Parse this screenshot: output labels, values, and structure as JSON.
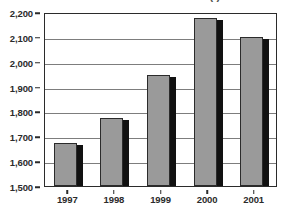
{
  "chart_data": {
    "type": "bar",
    "title": "(  )",
    "xlabel": "",
    "ylabel": "",
    "categories": [
      "1997",
      "1998",
      "1999",
      "2000",
      "2001"
    ],
    "values": [
      1672,
      1775,
      1945,
      2175,
      2100
    ],
    "ylim": [
      1500,
      2200
    ],
    "ytick_labels": [
      "2,200",
      "2,100",
      "2,000",
      "1,900",
      "1,800",
      "1,700",
      "1,600",
      "1,500"
    ],
    "yticks": [
      2200,
      2100,
      2000,
      1900,
      1800,
      1700,
      1600,
      1500
    ],
    "grid": true,
    "legend": false,
    "series": [
      {
        "name": "",
        "values": [
          1672,
          1775,
          1945,
          2175,
          2100
        ]
      }
    ],
    "colors": {
      "bar_face": "#9a9a9a",
      "bar_shadow": "#111111",
      "axis": "#2b2b2b",
      "gridline": "#7d7d7d",
      "background": "#ffffff"
    }
  }
}
